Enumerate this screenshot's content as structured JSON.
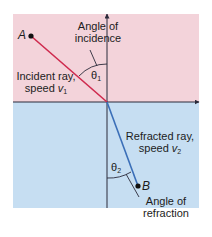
{
  "colors": {
    "upper_medium": "#f3d3da",
    "lower_medium": "#c6def2",
    "incident_ray": "#cf2a4e",
    "refracted_ray": "#3b6fb8",
    "axis": "#2a2a3a",
    "text": "#1c1c1c"
  },
  "points": {
    "A": "A",
    "B": "B"
  },
  "labels": {
    "angle_of_incidence_line1": "Angle of",
    "angle_of_incidence_line2": "incidence",
    "incident_ray_line1": "Incident ray,",
    "incident_ray_line2_prefix": "speed ",
    "incident_ray_speed_symbol": "v",
    "incident_ray_speed_sub": "1",
    "refracted_ray_line1": "Refracted ray,",
    "refracted_ray_line2_prefix": "speed ",
    "refracted_ray_speed_symbol": "v",
    "refracted_ray_speed_sub": "2",
    "angle_of_refraction_line1": "Angle of",
    "angle_of_refraction_line2": "refraction",
    "theta1_symbol": "θ",
    "theta1_sub": "1",
    "theta2_symbol": "θ",
    "theta2_sub": "2"
  }
}
